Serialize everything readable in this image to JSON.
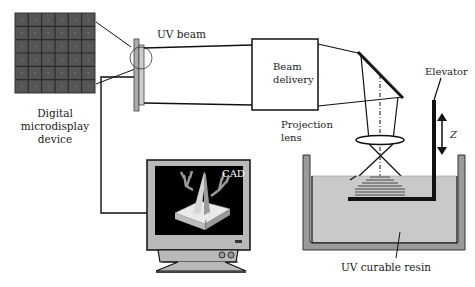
{
  "diagram": {
    "labels": {
      "microdisplay_line1": "Digital",
      "microdisplay_line2": "microdisplay",
      "microdisplay_line3": "device",
      "uv_beam": "UV beam",
      "beam_delivery_line1": "Beam",
      "beam_delivery_line2": "delivery",
      "projection_lens_line1": "Projection",
      "projection_lens_line2": "lens",
      "elevator": "Elevator",
      "z_axis": "Z",
      "cad": "CAD",
      "resin": "UV curable resin"
    },
    "components": [
      "digital-microdisplay-grid",
      "microdisplay-device",
      "uv-beam",
      "beam-delivery-box",
      "mirror",
      "projection-lens",
      "elevator",
      "resin-vat",
      "fabricated-part",
      "cad-computer"
    ],
    "grid": {
      "rows": 6,
      "cols": 6
    },
    "colors": {
      "grid_cell": "#555555",
      "grid_line": "#222222",
      "stroke": "#111111",
      "resin": "#c8c8c8",
      "vat": "#9a9a9a",
      "monitor_body": "#b8b8b8",
      "screen": "#000000",
      "part": "#8a8a8a"
    }
  }
}
